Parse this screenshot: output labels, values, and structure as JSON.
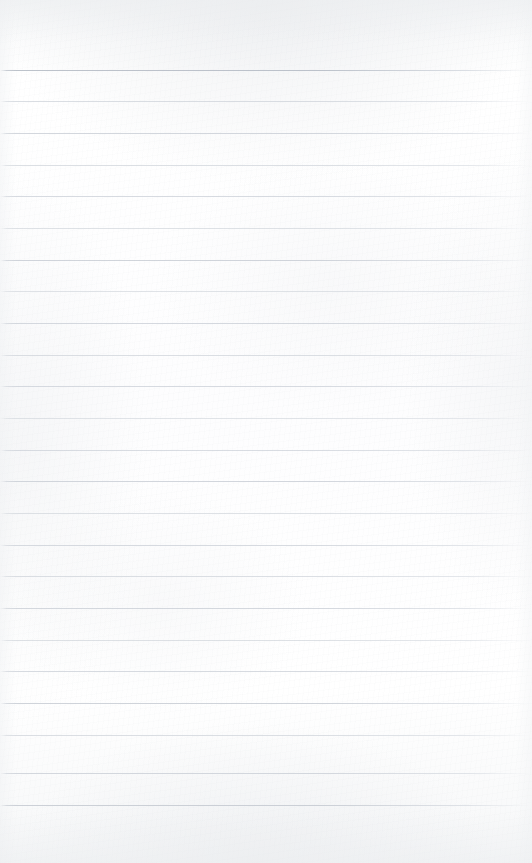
{
  "document": {
    "type": "lined-paper",
    "content_text": "",
    "page_width": 532,
    "page_height": 863,
    "background_color": "#fcfcfc",
    "paper_tint": "#fdfdfe"
  },
  "ruling": {
    "line_color": "#c9ced6",
    "line_color_faint": "#d9dde3",
    "line_thickness": 1,
    "first_line_y": 70,
    "line_spacing": 31.5,
    "line_count": 24,
    "left_inset": 0,
    "right_inset": 0,
    "top_margin": 70,
    "bottom_margin": 58,
    "vertical_margin_rule": false,
    "lines": [
      {
        "index": 1,
        "y": 70,
        "opacity": 0.95,
        "color": "#b9bfc8"
      },
      {
        "index": 2,
        "y": 101,
        "opacity": 0.72,
        "color": "#ccd1d8"
      },
      {
        "index": 3,
        "y": 133,
        "opacity": 0.78,
        "color": "#c7ccd4"
      },
      {
        "index": 4,
        "y": 165,
        "opacity": 0.7,
        "color": "#cdd2d9"
      },
      {
        "index": 5,
        "y": 196,
        "opacity": 0.74,
        "color": "#c9ced6"
      },
      {
        "index": 6,
        "y": 228,
        "opacity": 0.68,
        "color": "#cfd4da"
      },
      {
        "index": 7,
        "y": 260,
        "opacity": 0.8,
        "color": "#c5cad2"
      },
      {
        "index": 8,
        "y": 291,
        "opacity": 0.66,
        "color": "#d0d5db"
      },
      {
        "index": 9,
        "y": 323,
        "opacity": 0.76,
        "color": "#c8cdd5"
      },
      {
        "index": 10,
        "y": 355,
        "opacity": 0.7,
        "color": "#ccd1d8"
      },
      {
        "index": 11,
        "y": 386,
        "opacity": 0.74,
        "color": "#c9ced6"
      },
      {
        "index": 12,
        "y": 418,
        "opacity": 0.66,
        "color": "#d1d6dc"
      },
      {
        "index": 13,
        "y": 450,
        "opacity": 0.72,
        "color": "#cacfd7"
      },
      {
        "index": 14,
        "y": 481,
        "opacity": 0.78,
        "color": "#c6cbd3"
      },
      {
        "index": 15,
        "y": 513,
        "opacity": 0.68,
        "color": "#cfd4da"
      },
      {
        "index": 16,
        "y": 545,
        "opacity": 0.74,
        "color": "#c9ced6"
      },
      {
        "index": 17,
        "y": 576,
        "opacity": 0.7,
        "color": "#ccd1d8"
      },
      {
        "index": 18,
        "y": 608,
        "opacity": 0.76,
        "color": "#c7ccd4"
      },
      {
        "index": 19,
        "y": 640,
        "opacity": 0.68,
        "color": "#ced3d9"
      },
      {
        "index": 20,
        "y": 671,
        "opacity": 0.74,
        "color": "#c9ced6"
      },
      {
        "index": 21,
        "y": 703,
        "opacity": 0.8,
        "color": "#c4c9d1"
      },
      {
        "index": 22,
        "y": 735,
        "opacity": 0.7,
        "color": "#ccd1d8"
      },
      {
        "index": 23,
        "y": 773,
        "opacity": 0.76,
        "color": "#c7ccd4"
      },
      {
        "index": 24,
        "y": 805,
        "opacity": 0.82,
        "color": "#c2c7cf"
      }
    ]
  }
}
